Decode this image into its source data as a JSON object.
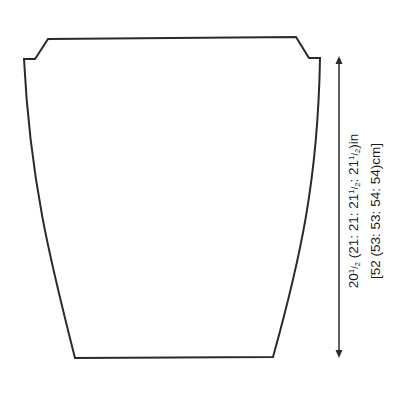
{
  "diagram": {
    "type": "knitting-schematic",
    "piece": "garment back/front panel",
    "stroke_color": "#2a2a2a",
    "background": "#ffffff",
    "shape_outline": {
      "top_left": [
        48,
        39
      ],
      "top_right": [
        296,
        37
      ],
      "left_shoulder_inner": [
        35,
        59
      ],
      "left_shoulder_outer": [
        24,
        59
      ],
      "right_shoulder_inner": [
        309,
        58
      ],
      "right_shoulder_outer": [
        320,
        58
      ],
      "bottom_left": [
        75,
        358
      ],
      "bottom_right": [
        273,
        357
      ]
    },
    "dimension_arrow": {
      "x": 339,
      "top_y": 58,
      "bottom_y": 357,
      "orientation": "vertical",
      "arrowheads": "both"
    },
    "measurement": {
      "imperial": {
        "base": "20",
        "base_frac": "1/2",
        "sizes": [
          "21",
          "21",
          "21 1/2",
          "21 1/2"
        ],
        "unit": "in",
        "text": "20½ (21: 21: 21½: 21½)in"
      },
      "metric": {
        "base": "52",
        "sizes": [
          "53",
          "53",
          "54",
          "54"
        ],
        "unit": "cm",
        "text": "[52 (53: 53: 54: 54)cm]"
      }
    }
  }
}
